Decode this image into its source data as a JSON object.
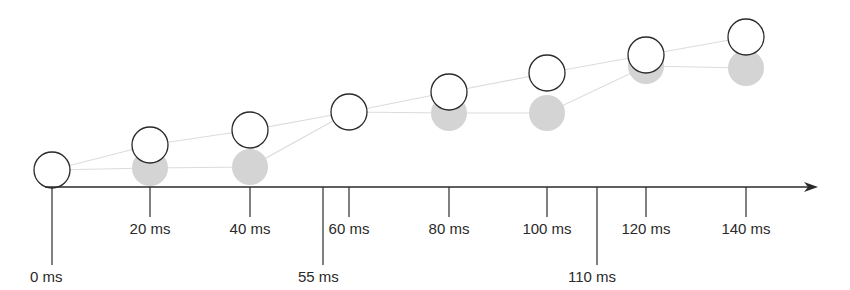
{
  "diagram": {
    "axis": {
      "y": 187,
      "x_start": 45,
      "x_end": 818,
      "color": "#2a2a2a"
    },
    "ticks": [
      {
        "label": "0 ms",
        "x": 52,
        "long": true
      },
      {
        "label": "20 ms",
        "x": 150,
        "long": false
      },
      {
        "label": "40 ms",
        "x": 250,
        "long": false
      },
      {
        "label": "55 ms",
        "x": 323,
        "long": true
      },
      {
        "label": "60 ms",
        "x": 349,
        "long": false
      },
      {
        "label": "80 ms",
        "x": 449,
        "long": false
      },
      {
        "label": "100 ms",
        "x": 547,
        "long": false
      },
      {
        "label": "110 ms",
        "x": 597,
        "long": true
      },
      {
        "label": "120 ms",
        "x": 646,
        "long": false
      },
      {
        "label": "140 ms",
        "x": 746,
        "long": false
      }
    ],
    "white_circles": [
      {
        "x": 52,
        "y": 170
      },
      {
        "x": 150,
        "y": 145
      },
      {
        "x": 250,
        "y": 130
      },
      {
        "x": 349,
        "y": 112
      },
      {
        "x": 449,
        "y": 92
      },
      {
        "x": 547,
        "y": 73
      },
      {
        "x": 646,
        "y": 55
      },
      {
        "x": 746,
        "y": 37
      }
    ],
    "gray_circles": [
      {
        "x": 52,
        "y": 170
      },
      {
        "x": 150,
        "y": 168
      },
      {
        "x": 250,
        "y": 167
      },
      {
        "x": 349,
        "y": 112
      },
      {
        "x": 449,
        "y": 113
      },
      {
        "x": 547,
        "y": 113
      },
      {
        "x": 646,
        "y": 66
      },
      {
        "x": 746,
        "y": 68
      }
    ],
    "circle_radius": 18,
    "colors": {
      "gray_fill": "#d4d4d4",
      "white_stroke": "#2a2a2a",
      "connector": "#dcdcdc"
    }
  }
}
